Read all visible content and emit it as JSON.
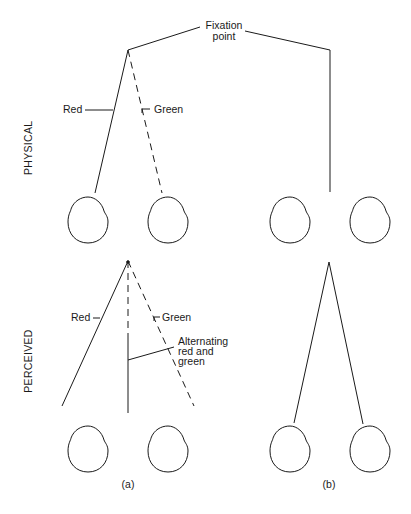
{
  "rows": {
    "physical": {
      "label": "PHYSICAL"
    },
    "perceived": {
      "label": "PERCEIVED"
    }
  },
  "annotations": {
    "fixation_point": "Fixation\npoint",
    "fixation_line1": "Fixation",
    "fixation_line2": "point",
    "physical_red": "Red",
    "physical_green": "Green",
    "perceived_red": "Red",
    "perceived_green": "Green",
    "alternating_line1": "Alternating",
    "alternating_line2": "red and",
    "alternating_line3": "green"
  },
  "panels": {
    "a": {
      "caption": "(a)"
    },
    "b": {
      "caption": "(b)"
    }
  },
  "colors": {
    "ink": "#1a1a1a",
    "background": "#ffffff"
  }
}
